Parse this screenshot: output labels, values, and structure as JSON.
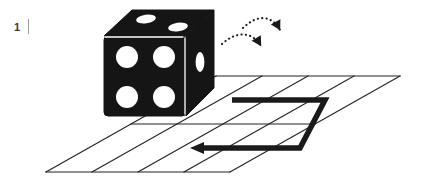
{
  "figure": {
    "index_label": "1",
    "caption": "",
    "background_color": "#ffffff",
    "ink_color": "#1a1a1a",
    "grid_line_color": "#222222",
    "pip_color": "#ffffff",
    "width": 423,
    "height": 189
  },
  "die": {
    "name": "die",
    "body_color": "#151515",
    "edge_highlight_color": "#ffffff",
    "front_face": {
      "value": 4,
      "pips": [
        {
          "cx": 127,
          "cy": 57,
          "rx": 11,
          "ry": 11
        },
        {
          "cx": 164,
          "cy": 57,
          "rx": 11,
          "ry": 11
        },
        {
          "cx": 127,
          "cy": 97,
          "rx": 11,
          "ry": 11
        },
        {
          "cx": 164,
          "cy": 97,
          "rx": 11,
          "ry": 11
        }
      ]
    },
    "top_face": {
      "value": 2,
      "pips": [
        {
          "cx": 144,
          "cy": 19,
          "rx": 10,
          "ry": 4.5,
          "rotate": -8
        },
        {
          "cx": 175,
          "cy": 27,
          "rx": 10,
          "ry": 4.5,
          "rotate": -8
        }
      ]
    },
    "right_face": {
      "value": 1,
      "pips": [
        {
          "cx": 200,
          "cy": 62,
          "rx": 4.5,
          "ry": 10,
          "rotate": 0
        }
      ]
    },
    "outline": {
      "front": "M 104,36 L 186,36 L 186,116 L 104,116 Z",
      "top": "M 104,36 L 132,10 L 214,10 L 186,36 Z",
      "right": "M 186,36 L 214,10 L 214,88 L 186,116 Z"
    }
  },
  "motion_arrows": {
    "name": "rolling-motion-arrows",
    "style": "dotted-curved-arrow",
    "color": "#1a1a1a",
    "items": [
      {
        "id": "arrow-lower",
        "path": "M 222,42 C 238,30 252,32 262,48",
        "head_point": [
          263,
          52
        ],
        "head_angle": 62,
        "description": "first tip-over arc pointing down-right"
      },
      {
        "id": "arrow-upper",
        "path": "M 240,28 C 256,14 272,16 281,32",
        "head_point": [
          282,
          36
        ],
        "head_angle": 62,
        "description": "second tip-over arc pointing down-right"
      }
    ]
  },
  "grid": {
    "name": "perspective-floor-grid",
    "columns": 4,
    "rows": 2,
    "line_color": "#222222",
    "line_width": 1.1,
    "corners": {
      "top_left": [
        216,
        76
      ],
      "top_right": [
        400,
        76
      ],
      "bottom_right": [
        230,
        172
      ],
      "bottom_left": [
        46,
        172
      ]
    },
    "horizontal_lines": [
      {
        "from": [
          216,
          76
        ],
        "to": [
          400,
          76
        ]
      },
      {
        "from": [
          131,
          124
        ],
        "to": [
          315,
          124
        ]
      },
      {
        "from": [
          46,
          172
        ],
        "to": [
          230,
          172
        ]
      }
    ],
    "diagonal_lines": [
      {
        "from": [
          216,
          76
        ],
        "to": [
          46,
          172
        ]
      },
      {
        "from": [
          262,
          76
        ],
        "to": [
          92,
          172
        ]
      },
      {
        "from": [
          308,
          76
        ],
        "to": [
          138,
          172
        ]
      },
      {
        "from": [
          354,
          76
        ],
        "to": [
          184,
          172
        ]
      },
      {
        "from": [
          400,
          76
        ],
        "to": [
          230,
          172
        ]
      }
    ]
  },
  "path": {
    "name": "die-travel-path",
    "color": "#1a1a1a",
    "stroke_width": 5.5,
    "points": [
      [
        232,
        100
      ],
      [
        325,
        100
      ],
      [
        300,
        148
      ],
      [
        196,
        148
      ]
    ],
    "arrowhead": {
      "tip": [
        190,
        148
      ],
      "direction": "left",
      "width": 15,
      "height": 11
    },
    "description": "bold S-shaped route: right, diagonal down-left, then left to arrow"
  }
}
